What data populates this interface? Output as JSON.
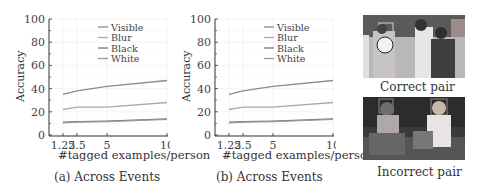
{
  "chart_data": [
    {
      "type": "line",
      "title": "",
      "caption": "(a) Across Events",
      "xlabel": "#tagged examples/person",
      "ylabel": "Accuracy",
      "x": [
        1.25,
        2.5,
        5,
        10
      ],
      "xticks": [
        "1.25",
        "2.5",
        "5",
        "10"
      ],
      "yticks": [
        "0",
        "20",
        "40",
        "60",
        "80",
        "100"
      ],
      "ylim": [
        0,
        100
      ],
      "grid": true,
      "legend_position": "upper center",
      "series": [
        {
          "name": "Visible",
          "values": [
            35,
            38,
            42,
            47
          ],
          "color": "#8a8a9a"
        },
        {
          "name": "Blur",
          "values": [
            22,
            24,
            24,
            28
          ],
          "color": "#a8a8b0"
        },
        {
          "name": "Black",
          "values": [
            11,
            11.5,
            12,
            14
          ],
          "color": "#777777"
        },
        {
          "name": "White",
          "values": [
            10.5,
            11,
            11.5,
            13.5
          ],
          "color": "#999999"
        }
      ]
    },
    {
      "type": "line",
      "title": "",
      "caption": "(b) Across Events",
      "xlabel": "#tagged examples/person",
      "ylabel": "Accuracy",
      "x": [
        1.25,
        2.5,
        5,
        10
      ],
      "xticks": [
        "1.25",
        "2.5",
        "5",
        "10"
      ],
      "yticks": [
        "0",
        "20",
        "40",
        "60",
        "80",
        "100"
      ],
      "ylim": [
        0,
        100
      ],
      "grid": true,
      "legend_position": "upper center",
      "series": [
        {
          "name": "Visible",
          "values": [
            35,
            38,
            42,
            47
          ],
          "color": "#8a8a9a"
        },
        {
          "name": "Blur",
          "values": [
            22,
            24,
            24,
            28
          ],
          "color": "#a8a8b0"
        },
        {
          "name": "Black",
          "values": [
            11,
            11.5,
            12,
            14
          ],
          "color": "#777777"
        },
        {
          "name": "White",
          "values": [
            10.5,
            11,
            11.5,
            13.5
          ],
          "color": "#999999"
        }
      ]
    }
  ],
  "charts": {
    "a": {
      "caption": "(a) Across Events",
      "xlabel": "#tagged examples/person",
      "ylabel": "Accuracy"
    },
    "b": {
      "caption": "(b) Across Events",
      "xlabel": "#tagged examples/person",
      "ylabel": "Accuracy"
    }
  },
  "photos": {
    "correct": {
      "caption": "Correct pair"
    },
    "incorrect": {
      "caption": "Incorrect pair"
    }
  }
}
